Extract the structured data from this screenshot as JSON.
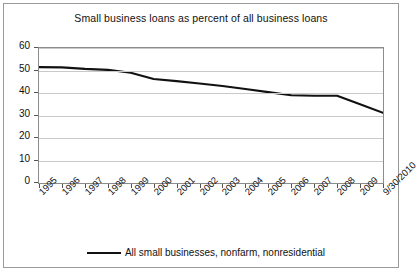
{
  "chart_data": {
    "type": "line",
    "title": "Small business loans as percent of all business loans",
    "xlabel": "",
    "ylabel": "",
    "ylim": [
      0,
      60
    ],
    "yticks": [
      0,
      10,
      20,
      30,
      40,
      50,
      60
    ],
    "grid": true,
    "legend_position": "bottom",
    "categories": [
      "1995",
      "1996",
      "1997",
      "1998",
      "1999",
      "2000",
      "2001",
      "2002",
      "2003",
      "2004",
      "2005",
      "2006",
      "2007",
      "2008",
      "2009",
      "9/30/2010"
    ],
    "series": [
      {
        "name": "All small businesses, nonfarm, nonresidential",
        "color": "#111111",
        "values": [
          51.5,
          51.4,
          50.7,
          50.3,
          49.0,
          46.2,
          45.3,
          44.2,
          43.1,
          41.8,
          40.4,
          39.0,
          38.8,
          38.8,
          35.0,
          31.2
        ]
      }
    ]
  },
  "legend": {
    "entries": [
      {
        "label": "All small businesses, nonfarm, nonresidential"
      }
    ]
  }
}
